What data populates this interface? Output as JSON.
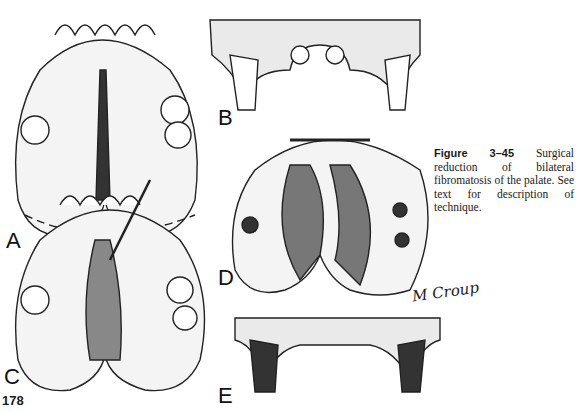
{
  "figure": {
    "number": "Figure 3–45",
    "caption": "Surgical reduction of bilateral fibromatosis of the palate. See text for description of technique."
  },
  "panels": [
    {
      "label": "A",
      "description": "Palate with bilateral fibromatosis, dashed excision outline"
    },
    {
      "label": "B",
      "description": "Cross-section of maxilla showing hyperplastic tissue"
    },
    {
      "label": "C",
      "description": "Incision of palatal tissue with scalpel"
    },
    {
      "label": "D",
      "description": "Sutured flaps after reduction"
    },
    {
      "label": "E",
      "description": "Cross-section after reduction"
    }
  ],
  "signature": "M Croup",
  "page_number": "178"
}
